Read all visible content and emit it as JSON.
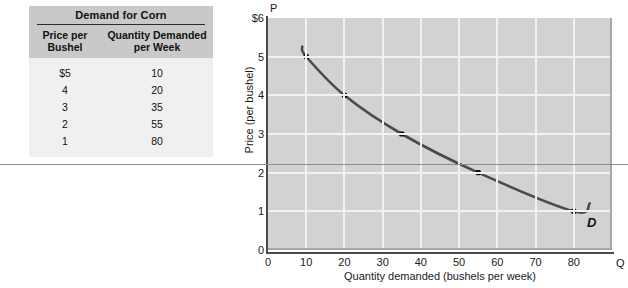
{
  "table": {
    "title": "Demand for Corn",
    "columns": [
      {
        "line1": "Price per",
        "line2": "Bushel"
      },
      {
        "line1": "Quantity Demanded",
        "line2": "per Week"
      }
    ],
    "rows": [
      {
        "price": "$5",
        "quantity": "10"
      },
      {
        "price": "4",
        "quantity": "20"
      },
      {
        "price": "3",
        "quantity": "35"
      },
      {
        "price": "2",
        "quantity": "55"
      },
      {
        "price": "1",
        "quantity": "80"
      }
    ]
  },
  "chart_data": {
    "type": "line",
    "title": "",
    "xlabel": "Quantity demanded (bushels per week)",
    "ylabel": "Price (per bushel)",
    "x_axis_symbol": "Q",
    "y_axis_symbol": "P",
    "xlim": [
      0,
      90
    ],
    "ylim": [
      0,
      6
    ],
    "grid": true,
    "xticks": [
      "0",
      "10",
      "20",
      "30",
      "40",
      "50",
      "60",
      "70",
      "80"
    ],
    "xtick_values": [
      0,
      10,
      20,
      30,
      40,
      50,
      60,
      70,
      80
    ],
    "yticks": [
      "0",
      "1",
      "2",
      "3",
      "4",
      "5",
      "$6"
    ],
    "ytick_values": [
      0,
      1,
      2,
      3,
      4,
      5,
      6
    ],
    "series": [
      {
        "name": "D",
        "label": "D",
        "x": [
          10,
          20,
          35,
          55,
          80
        ],
        "values": [
          5,
          4,
          3,
          2,
          1
        ],
        "color": "#4a4a4a",
        "marker": "square"
      }
    ],
    "annotations": [
      {
        "text": "D",
        "x": 86,
        "y": 0.8
      }
    ],
    "legend": "none"
  },
  "colors": {
    "plot_background": "#d2d2d2",
    "gridline": "#f2f2f2",
    "curve": "#4a4a4a",
    "axis": "#4a4a4a",
    "table_header": "#c9c9c9",
    "table_body": "#f0f0f0",
    "rule": "#8d8d8d"
  }
}
